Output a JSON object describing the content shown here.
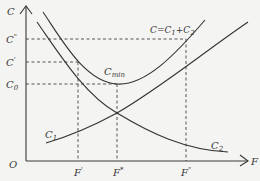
{
  "diagram": {
    "type": "cost-curve",
    "axes": {
      "y_label": "C",
      "x_label": "F",
      "origin_label": "O"
    },
    "y_ticks": [
      {
        "label": "C\"",
        "main": "C",
        "sup": "\"",
        "sub": ""
      },
      {
        "label": "C'",
        "main": "C",
        "sup": "'",
        "sub": ""
      },
      {
        "label": "C0",
        "main": "C",
        "sup": "",
        "sub": "0"
      }
    ],
    "x_ticks": [
      {
        "label": "F'",
        "main": "F",
        "sup": "'"
      },
      {
        "label": "F*",
        "main": "F",
        "sup": "*"
      },
      {
        "label": "F\"",
        "main": "F",
        "sup": "\""
      }
    ],
    "curves": {
      "total": {
        "label": "C=C1+C2",
        "text_main": "C=C",
        "sub1": "1",
        "plus": "+C",
        "sub2": "2"
      },
      "c1": {
        "label": "C1",
        "main": "C",
        "sub": "1"
      },
      "c2": {
        "label": "C2",
        "main": "C",
        "sub": "2"
      }
    },
    "minimum": {
      "label": "Cmin",
      "main": "C",
      "sub": "min"
    }
  }
}
